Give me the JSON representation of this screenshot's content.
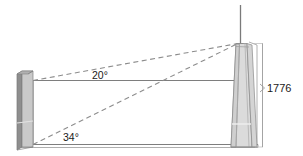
{
  "figure": {
    "type": "geometry-diagram",
    "title": "",
    "labels": {
      "angle_upper": "20°",
      "angle_lower": "34°",
      "height": "1776"
    },
    "colors": {
      "line": "#6f6f6f",
      "dashed": "#8c8c8c",
      "text": "#1a1a1a",
      "building_left_side": "#8e8e8e",
      "building_left_face": "#c9c9c9",
      "building_left_top": "#b5b5b5",
      "tower_face": "#dcdcdc",
      "tower_side": "#cfcfcf",
      "tower_outline": "#8a8a8a",
      "spire": "#7a7a7a",
      "background": "#ffffff"
    },
    "geometry": {
      "ground_line_y": 144,
      "sight_line_y": 80,
      "tower_apex_x": 238,
      "tower_apex_y": 43,
      "observer_x": 33,
      "dimension_line_x": 262,
      "dimension_top_y": 43,
      "dimension_bottom_y": 147,
      "spire_top_y": 5
    }
  }
}
